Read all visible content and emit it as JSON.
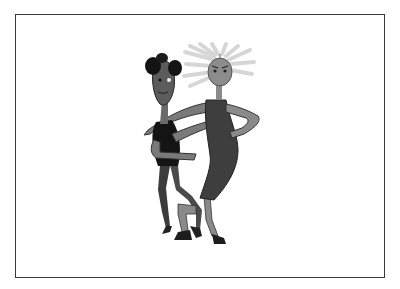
{
  "image": {
    "description": "Grayscale cartoon illustration of two dancing figures inside a thin dark rectangular frame",
    "background": "#ffffff",
    "frame_color": "#3a3a3a",
    "figures": [
      {
        "name": "man",
        "position": "left",
        "hair": "dark curly",
        "shirt": "black",
        "trousers": "dark gray",
        "skin_tone": "#6e6e6e"
      },
      {
        "name": "woman",
        "position": "right",
        "hair": "light gray spiky",
        "dress": "dark gray",
        "skin_tone": "#8c8c8c"
      }
    ],
    "colors": {
      "black": "#111111",
      "dark_gray": "#3c3c3c",
      "mid_gray": "#6e6e6e",
      "light_gray": "#8e8e8e",
      "hair_light": "#d8d8d8"
    }
  }
}
